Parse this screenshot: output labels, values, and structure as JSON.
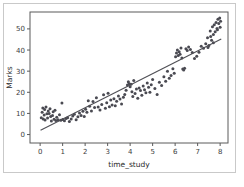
{
  "figure": {
    "background_color": "#ffffff",
    "border_color": "#c9c9c9",
    "axes_color": "#5a5a5a"
  },
  "chart_data": {
    "type": "scatter",
    "title": "",
    "xlabel": "time_study",
    "ylabel": "Marks",
    "xlim": [
      -0.45,
      8.35
    ],
    "ylim": [
      -4.0,
      58.0
    ],
    "xticks": [
      0,
      1,
      2,
      3,
      4,
      5,
      6,
      7,
      8
    ],
    "xticklabels": [
      "0",
      "1",
      "2",
      "3",
      "4",
      "5",
      "6",
      "7",
      "8"
    ],
    "yticks": [
      0,
      10,
      20,
      30,
      40,
      50
    ],
    "yticklabels": [
      "0",
      "10",
      "20",
      "30",
      "40",
      "50"
    ],
    "grid": false,
    "legend": null,
    "marker_color": "#4a4a52",
    "marker_size": 3.0,
    "line_color": "#4f4f55",
    "line_width": 1.1,
    "regression_line": {
      "label": "regression-line",
      "x": [
        0.02,
        8.05
      ],
      "y": [
        2.0,
        45.2
      ],
      "slope": 5.38,
      "intercept": 1.89
    },
    "points": [
      [
        0.05,
        8.0
      ],
      [
        0.09,
        10.5
      ],
      [
        0.12,
        12.6
      ],
      [
        0.14,
        7.4
      ],
      [
        0.18,
        9.3
      ],
      [
        0.2,
        11.8
      ],
      [
        0.22,
        6.9
      ],
      [
        0.26,
        13.0
      ],
      [
        0.3,
        9.9
      ],
      [
        0.33,
        7.8
      ],
      [
        0.36,
        11.2
      ],
      [
        0.4,
        10.0
      ],
      [
        0.44,
        12.2
      ],
      [
        0.47,
        8.6
      ],
      [
        0.5,
        6.4
      ],
      [
        0.55,
        9.0
      ],
      [
        0.58,
        10.8
      ],
      [
        0.62,
        7.2
      ],
      [
        0.66,
        11.5
      ],
      [
        0.7,
        6.6
      ],
      [
        0.74,
        8.2
      ],
      [
        0.8,
        7.0
      ],
      [
        0.86,
        9.4
      ],
      [
        0.92,
        6.8
      ],
      [
        0.97,
        14.9
      ],
      [
        1.0,
        7.1
      ],
      [
        1.08,
        6.5
      ],
      [
        1.15,
        7.6
      ],
      [
        1.22,
        8.0
      ],
      [
        1.3,
        6.2
      ],
      [
        1.38,
        7.3
      ],
      [
        1.45,
        8.8
      ],
      [
        1.52,
        9.6
      ],
      [
        1.6,
        7.0
      ],
      [
        1.68,
        8.4
      ],
      [
        1.75,
        10.2
      ],
      [
        1.82,
        9.0
      ],
      [
        1.9,
        11.0
      ],
      [
        1.96,
        8.6
      ],
      [
        2.02,
        12.0
      ],
      [
        2.08,
        10.5
      ],
      [
        2.14,
        16.0
      ],
      [
        2.2,
        13.4
      ],
      [
        2.28,
        11.2
      ],
      [
        2.35,
        15.6
      ],
      [
        2.42,
        12.8
      ],
      [
        2.5,
        17.4
      ],
      [
        2.58,
        13.0
      ],
      [
        2.66,
        11.6
      ],
      [
        2.74,
        14.2
      ],
      [
        2.82,
        18.8
      ],
      [
        2.9,
        12.4
      ],
      [
        2.96,
        15.0
      ],
      [
        3.02,
        19.6
      ],
      [
        3.08,
        13.2
      ],
      [
        3.14,
        16.4
      ],
      [
        3.2,
        14.0
      ],
      [
        3.28,
        17.0
      ],
      [
        3.34,
        13.6
      ],
      [
        3.4,
        15.8
      ],
      [
        3.48,
        18.2
      ],
      [
        3.55,
        16.8
      ],
      [
        3.62,
        14.4
      ],
      [
        3.7,
        17.6
      ],
      [
        3.76,
        19.0
      ],
      [
        3.82,
        21.0
      ],
      [
        3.88,
        23.4
      ],
      [
        3.92,
        25.0
      ],
      [
        3.96,
        24.0
      ],
      [
        4.0,
        22.6
      ],
      [
        4.04,
        23.8
      ],
      [
        4.08,
        20.2
      ],
      [
        4.12,
        18.0
      ],
      [
        4.16,
        25.6
      ],
      [
        4.22,
        19.4
      ],
      [
        4.28,
        21.6
      ],
      [
        4.34,
        17.2
      ],
      [
        4.4,
        22.0
      ],
      [
        4.46,
        20.8
      ],
      [
        4.52,
        18.6
      ],
      [
        4.58,
        23.0
      ],
      [
        4.64,
        21.2
      ],
      [
        4.7,
        19.8
      ],
      [
        4.76,
        24.4
      ],
      [
        4.82,
        22.4
      ],
      [
        4.88,
        20.0
      ],
      [
        4.94,
        23.6
      ],
      [
        5.0,
        26.0
      ],
      [
        5.1,
        21.8
      ],
      [
        5.2,
        19.0
      ],
      [
        5.3,
        24.8
      ],
      [
        5.4,
        23.2
      ],
      [
        5.5,
        27.4
      ],
      [
        5.58,
        25.2
      ],
      [
        5.66,
        30.0
      ],
      [
        5.74,
        26.6
      ],
      [
        5.82,
        28.0
      ],
      [
        5.9,
        31.2
      ],
      [
        5.96,
        29.0
      ],
      [
        6.02,
        36.8
      ],
      [
        6.06,
        38.6
      ],
      [
        6.1,
        40.0
      ],
      [
        6.14,
        37.4
      ],
      [
        6.18,
        39.2
      ],
      [
        6.22,
        38.0
      ],
      [
        6.26,
        41.0
      ],
      [
        6.3,
        36.2
      ],
      [
        6.34,
        31.0
      ],
      [
        6.38,
        30.6
      ],
      [
        6.42,
        31.4
      ],
      [
        6.48,
        40.6
      ],
      [
        6.54,
        39.8
      ],
      [
        6.6,
        41.4
      ],
      [
        6.68,
        40.2
      ],
      [
        6.76,
        38.8
      ],
      [
        6.86,
        36.0
      ],
      [
        6.96,
        37.0
      ],
      [
        7.06,
        39.0
      ],
      [
        7.16,
        41.8
      ],
      [
        7.26,
        40.8
      ],
      [
        7.36,
        43.0
      ],
      [
        7.44,
        45.8
      ],
      [
        7.5,
        42.2
      ],
      [
        7.56,
        49.0
      ],
      [
        7.62,
        44.6
      ],
      [
        7.66,
        51.0
      ],
      [
        7.7,
        47.4
      ],
      [
        7.74,
        52.0
      ],
      [
        7.78,
        48.6
      ],
      [
        7.82,
        53.0
      ],
      [
        7.86,
        50.2
      ],
      [
        7.9,
        54.6
      ],
      [
        7.94,
        52.6
      ],
      [
        7.98,
        55.2
      ],
      [
        8.02,
        53.6
      ],
      [
        7.7,
        43.4
      ],
      [
        7.58,
        46.4
      ],
      [
        7.88,
        49.6
      ],
      [
        8.0,
        50.8
      ],
      [
        7.46,
        41.2
      ]
    ]
  }
}
